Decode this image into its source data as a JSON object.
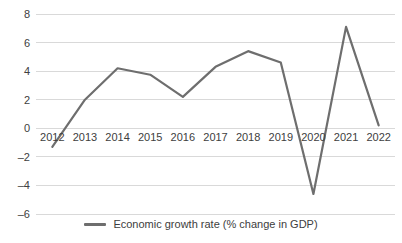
{
  "chart_data": {
    "type": "line",
    "title": "",
    "xlabel": "",
    "ylabel": "",
    "categories": [
      "2012",
      "2013",
      "2014",
      "2015",
      "2016",
      "2017",
      "2018",
      "2019",
      "2020",
      "2021",
      "2022"
    ],
    "series": [
      {
        "name": "Economic growth rate (% change in GDP)",
        "color": "#6e6e6e",
        "values": [
          -1.3,
          2.0,
          4.2,
          3.75,
          2.2,
          4.3,
          5.4,
          4.6,
          -4.6,
          7.1,
          0.2
        ]
      }
    ],
    "ylim": [
      -6,
      8
    ],
    "yticks": [
      8,
      6,
      4,
      2,
      0,
      -2,
      -4,
      -6
    ],
    "ytick_labels": [
      "8",
      "6",
      "4",
      "2",
      "0",
      "–2",
      "–4",
      "–6"
    ],
    "grid": "horizontal",
    "legend_position": "bottom"
  },
  "legend": {
    "items": [
      {
        "label": "Economic growth rate (% change in GDP)",
        "color": "#6e6e6e"
      }
    ]
  },
  "colors": {
    "line": "#6e6e6e",
    "gridline": "#d9d9d9",
    "axis_text": "#404040",
    "background": "#ffffff"
  }
}
